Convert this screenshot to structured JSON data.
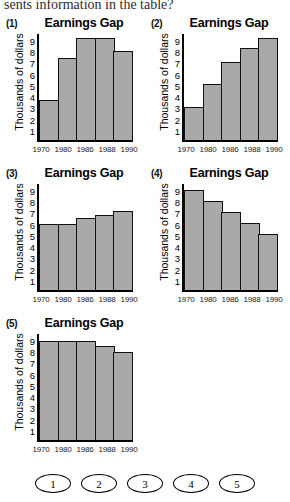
{
  "question": {
    "stem_text": "sents information in the table?"
  },
  "common": {
    "title": "Earnings Gap",
    "ylabel": "Thousands of dollars",
    "yticks": [
      "9",
      "8",
      "7",
      "6",
      "5",
      "4",
      "3",
      "2",
      "1"
    ],
    "xticks": [
      "1970",
      "1980",
      "1986",
      "1988",
      "1990"
    ],
    "bar_color": "#a9a9a9",
    "axis_color": "#000000"
  },
  "answers": {
    "choices": [
      "1",
      "2",
      "3",
      "4",
      "5"
    ]
  },
  "chart_data": [
    {
      "id": "1",
      "number_label": "(1)",
      "type": "bar",
      "title": "Earnings Gap",
      "xlabel": "",
      "ylabel": "Thousands of dollars",
      "categories": [
        "1970",
        "1980",
        "1986",
        "1988",
        "1990"
      ],
      "values": [
        3.6,
        7.4,
        9.2,
        9.2,
        8.1
      ],
      "ylim": [
        0,
        9.6
      ],
      "grid": false,
      "legend": "none"
    },
    {
      "id": "2",
      "number_label": "(2)",
      "type": "bar",
      "title": "Earnings Gap",
      "xlabel": "",
      "ylabel": "Thousands of dollars",
      "categories": [
        "1970",
        "1980",
        "1986",
        "1988",
        "1990"
      ],
      "values": [
        3.0,
        5.1,
        7.1,
        8.3,
        9.2
      ],
      "ylim": [
        0,
        9.6
      ],
      "grid": false,
      "legend": "none"
    },
    {
      "id": "3",
      "number_label": "(3)",
      "type": "bar",
      "title": "Earnings Gap",
      "xlabel": "",
      "ylabel": "Thousands of dollars",
      "categories": [
        "1970",
        "1980",
        "1986",
        "1988",
        "1990"
      ],
      "values": [
        6.0,
        6.0,
        6.5,
        6.8,
        7.2
      ],
      "ylim": [
        0,
        9.6
      ],
      "grid": false,
      "legend": "none"
    },
    {
      "id": "4",
      "number_label": "(4)",
      "type": "bar",
      "title": "Earnings Gap",
      "xlabel": "",
      "ylabel": "Thousands of dollars",
      "categories": [
        "1970",
        "1980",
        "1986",
        "1988",
        "1990"
      ],
      "values": [
        9.1,
        8.1,
        7.1,
        6.1,
        5.1
      ],
      "ylim": [
        0,
        9.6
      ],
      "grid": false,
      "legend": "none"
    },
    {
      "id": "5",
      "number_label": "(5)",
      "type": "bar",
      "title": "Earnings Gap",
      "xlabel": "",
      "ylabel": "Thousands of dollars",
      "categories": [
        "1970",
        "1980",
        "1986",
        "1988",
        "1990"
      ],
      "values": [
        9.0,
        9.0,
        9.0,
        8.5,
        8.0
      ],
      "ylim": [
        0,
        9.6
      ],
      "grid": false,
      "legend": "none"
    }
  ]
}
